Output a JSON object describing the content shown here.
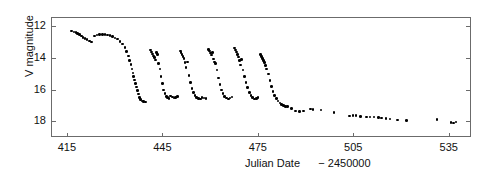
{
  "chart_data": {
    "type": "scatter",
    "title": "",
    "xlabel": "Julian Date   − 2450000",
    "xlabel_main": "Julian Date",
    "xlabel_offset": "− 2450000",
    "ylabel": "V magnitude",
    "xlim": [
      410,
      542
    ],
    "ylim": [
      19.0,
      11.4
    ],
    "y_inverted": true,
    "grid": false,
    "legend": null,
    "xticks": [
      415,
      445,
      475,
      505,
      535
    ],
    "yticks": [
      12,
      14,
      16,
      18
    ],
    "marker": "filled-circle",
    "marker_color": "#000000",
    "series": [
      {
        "name": "V magnitude",
        "points": [
          [
            416.2,
            12.22
          ],
          [
            416.9,
            12.28
          ],
          [
            417.5,
            12.33
          ],
          [
            418.1,
            12.38
          ],
          [
            418.6,
            12.46
          ],
          [
            419.2,
            12.55
          ],
          [
            419.8,
            12.62
          ],
          [
            420.4,
            12.7
          ],
          [
            421.0,
            12.78
          ],
          [
            421.7,
            12.86
          ],
          [
            422.5,
            12.93
          ],
          [
            423.4,
            12.55
          ],
          [
            424.2,
            12.48
          ],
          [
            425.0,
            12.45
          ],
          [
            425.8,
            12.44
          ],
          [
            426.6,
            12.45
          ],
          [
            427.4,
            12.47
          ],
          [
            428.2,
            12.52
          ],
          [
            429.0,
            12.58
          ],
          [
            429.8,
            12.66
          ],
          [
            430.6,
            12.74
          ],
          [
            431.4,
            12.88
          ],
          [
            432.2,
            13.05
          ],
          [
            432.9,
            13.25
          ],
          [
            433.5,
            13.52
          ],
          [
            434.0,
            13.8
          ],
          [
            434.4,
            14.1
          ],
          [
            434.8,
            14.35
          ],
          [
            435.1,
            14.62
          ],
          [
            435.4,
            14.88
          ],
          [
            435.7,
            15.1
          ],
          [
            436.0,
            15.32
          ],
          [
            436.3,
            15.55
          ],
          [
            436.6,
            15.78
          ],
          [
            436.9,
            16.0
          ],
          [
            437.2,
            16.22
          ],
          [
            437.5,
            16.42
          ],
          [
            437.9,
            16.58
          ],
          [
            438.3,
            16.66
          ],
          [
            438.8,
            16.7
          ],
          [
            439.4,
            16.72
          ],
          [
            441.0,
            13.42
          ],
          [
            441.3,
            13.55
          ],
          [
            441.6,
            13.68
          ],
          [
            441.9,
            13.8
          ],
          [
            442.2,
            13.92
          ],
          [
            442.5,
            14.06
          ],
          [
            442.8,
            13.6
          ],
          [
            443.1,
            13.7
          ],
          [
            443.5,
            14.3
          ],
          [
            443.9,
            14.62
          ],
          [
            444.3,
            15.1
          ],
          [
            444.7,
            15.55
          ],
          [
            445.1,
            15.95
          ],
          [
            445.5,
            16.18
          ],
          [
            445.9,
            16.36
          ],
          [
            446.3,
            16.44
          ],
          [
            446.8,
            16.48
          ],
          [
            447.3,
            16.34
          ],
          [
            447.8,
            16.4
          ],
          [
            448.3,
            16.46
          ],
          [
            448.9,
            16.44
          ],
          [
            449.5,
            16.38
          ],
          [
            450.3,
            13.48
          ],
          [
            450.6,
            13.6
          ],
          [
            450.9,
            13.72
          ],
          [
            451.2,
            13.84
          ],
          [
            451.5,
            13.98
          ],
          [
            451.8,
            14.2
          ],
          [
            452.1,
            14.52
          ],
          [
            452.5,
            14.18
          ],
          [
            453.0,
            15.05
          ],
          [
            453.5,
            15.48
          ],
          [
            454.0,
            15.88
          ],
          [
            454.5,
            16.12
          ],
          [
            455.0,
            16.3
          ],
          [
            455.5,
            16.42
          ],
          [
            456.0,
            16.48
          ],
          [
            456.6,
            16.52
          ],
          [
            457.2,
            16.42
          ],
          [
            457.8,
            16.46
          ],
          [
            458.4,
            16.5
          ],
          [
            459.2,
            13.38
          ],
          [
            459.5,
            13.5
          ],
          [
            459.8,
            13.62
          ],
          [
            460.1,
            13.74
          ],
          [
            460.4,
            13.6
          ],
          [
            460.7,
            14.0
          ],
          [
            461.0,
            14.18
          ],
          [
            461.4,
            14.3
          ],
          [
            461.8,
            14.7
          ],
          [
            462.3,
            15.2
          ],
          [
            462.8,
            15.62
          ],
          [
            463.3,
            15.95
          ],
          [
            463.8,
            16.2
          ],
          [
            464.3,
            16.36
          ],
          [
            464.8,
            16.46
          ],
          [
            465.4,
            16.52
          ],
          [
            466.0,
            16.46
          ],
          [
            466.6,
            16.4
          ],
          [
            467.4,
            13.3
          ],
          [
            467.7,
            13.42
          ],
          [
            468.0,
            13.56
          ],
          [
            468.3,
            13.7
          ],
          [
            468.6,
            13.88
          ],
          [
            468.9,
            14.1
          ],
          [
            469.2,
            14.38
          ],
          [
            469.6,
            14.02
          ],
          [
            470.0,
            14.7
          ],
          [
            470.5,
            15.1
          ],
          [
            471.0,
            15.48
          ],
          [
            471.5,
            15.82
          ],
          [
            472.0,
            16.1
          ],
          [
            472.5,
            16.3
          ],
          [
            473.0,
            16.44
          ],
          [
            473.6,
            16.52
          ],
          [
            474.2,
            16.48
          ],
          [
            474.8,
            16.44
          ],
          [
            475.6,
            13.72
          ],
          [
            475.9,
            13.84
          ],
          [
            476.2,
            13.96
          ],
          [
            476.5,
            14.08
          ],
          [
            476.8,
            14.22
          ],
          [
            477.1,
            14.4
          ],
          [
            477.5,
            14.62
          ],
          [
            478.0,
            14.95
          ],
          [
            478.5,
            15.35
          ],
          [
            479.0,
            15.75
          ],
          [
            479.5,
            16.05
          ],
          [
            480.0,
            16.3
          ],
          [
            480.5,
            16.5
          ],
          [
            481.0,
            16.66
          ],
          [
            481.6,
            16.78
          ],
          [
            482.2,
            16.88
          ],
          [
            482.8,
            16.95
          ],
          [
            483.4,
            17.0
          ],
          [
            484.0,
            17.02
          ],
          [
            485.2,
            17.12
          ],
          [
            486.6,
            17.3
          ],
          [
            487.8,
            17.34
          ],
          [
            489.0,
            17.28
          ],
          [
            491.2,
            17.16
          ],
          [
            492.0,
            17.18
          ],
          [
            494.5,
            17.22
          ],
          [
            498.6,
            17.38
          ],
          [
            503.5,
            17.6
          ],
          [
            504.6,
            17.56
          ],
          [
            505.6,
            17.58
          ],
          [
            507.0,
            17.62
          ],
          [
            508.8,
            17.66
          ],
          [
            510.0,
            17.68
          ],
          [
            511.2,
            17.66
          ],
          [
            512.6,
            17.72
          ],
          [
            513.6,
            17.74
          ],
          [
            515.0,
            17.78
          ],
          [
            516.2,
            17.8
          ],
          [
            518.6,
            17.86
          ],
          [
            521.4,
            17.9
          ],
          [
            531.0,
            17.82
          ],
          [
            535.4,
            18.02
          ],
          [
            536.2,
            18.04
          ],
          [
            537.0,
            17.98
          ]
        ]
      }
    ]
  }
}
